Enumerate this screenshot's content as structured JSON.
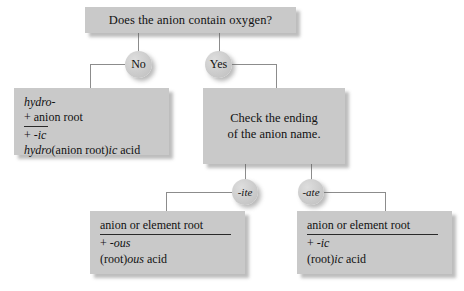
{
  "diagram": {
    "title_box": {
      "text": "Does the anion contain oxygen?"
    },
    "branches": {
      "no_label": "No",
      "yes_label": "Yes",
      "ite_label": "-ite",
      "ate_label": "-ate"
    },
    "hydro_box": {
      "line1": "hydro-",
      "line2": "+ anion root",
      "line3_plus": "+ ",
      "line3_affix": "-ic",
      "result_pre": "hydro",
      "result_mid": "(anion root)",
      "result_affix": "ic",
      "result_post": " acid"
    },
    "check_box": {
      "line1": "Check the ending",
      "line2": "of the anion name."
    },
    "ous_box": {
      "line1": "anion or element root",
      "line2_plus": "+ ",
      "line2_affix": "-ous",
      "result_pre": "(root)",
      "result_affix": "ous",
      "result_post": " acid"
    },
    "ic_box": {
      "line1": "anion or element root",
      "line2_plus": "+ ",
      "line2_affix": "-ic",
      "result_pre": "(root)",
      "result_affix": "ic",
      "result_post": " acid"
    }
  }
}
